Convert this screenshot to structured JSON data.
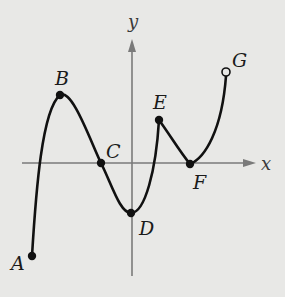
{
  "figure": {
    "axes": {
      "x_label": "x",
      "y_label": "y",
      "axis_color": "#7a7a7a"
    },
    "curve_color": "#111111",
    "background": "#e8e8e6",
    "points": [
      {
        "id": "A",
        "label": "A",
        "x": 32,
        "y": 256,
        "filled": true
      },
      {
        "id": "B",
        "label": "B",
        "x": 60,
        "y": 95,
        "filled": true
      },
      {
        "id": "C",
        "label": "C",
        "x": 101,
        "y": 163,
        "filled": true
      },
      {
        "id": "D",
        "label": "D",
        "x": 131,
        "y": 213,
        "filled": true
      },
      {
        "id": "E",
        "label": "E",
        "x": 159,
        "y": 120,
        "filled": true
      },
      {
        "id": "F",
        "label": "F",
        "x": 190,
        "y": 164,
        "filled": true
      },
      {
        "id": "G",
        "label": "G",
        "x": 226,
        "y": 72,
        "filled": false
      }
    ]
  },
  "labels": {
    "A": "A",
    "B": "B",
    "C": "C",
    "D": "D",
    "E": "E",
    "F": "F",
    "G": "G",
    "x": "x",
    "y": "y"
  }
}
